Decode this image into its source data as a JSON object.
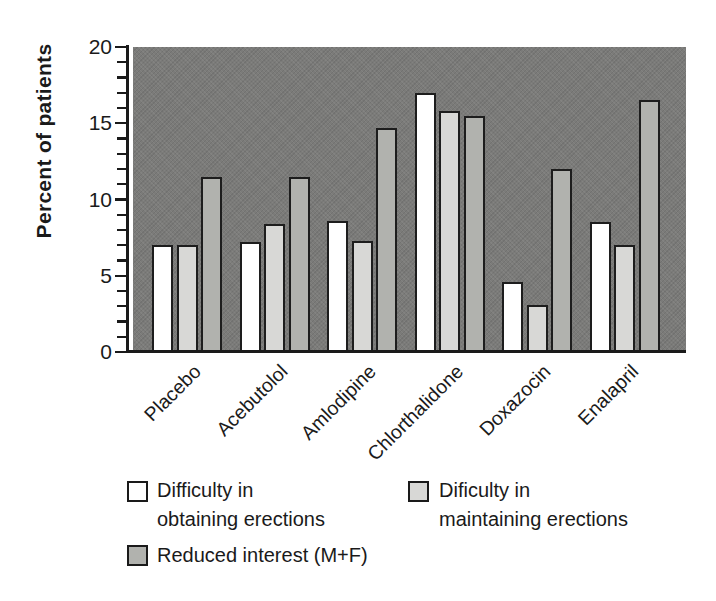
{
  "chart_data": {
    "type": "bar",
    "title": "",
    "ylabel": "Percent of patients",
    "xlabel": "",
    "ylim": [
      0,
      20
    ],
    "y_major_ticks": [
      0,
      5,
      10,
      15,
      20
    ],
    "y_minor_step": 1,
    "grid": false,
    "legend_position": "bottom",
    "plot_background": "#7b7b79",
    "axis_color": "#1a1a1a",
    "categories": [
      "Placebo",
      "Acebutolol",
      "Amlodipine",
      "Chlorthalidone",
      "Doxazocin",
      "Enalapril"
    ],
    "series": [
      {
        "name": "Difficulty in obtaining erections",
        "color": "#ffffff",
        "values": [
          7.0,
          7.2,
          8.6,
          17.0,
          4.6,
          8.5
        ]
      },
      {
        "name": "Dificulty in maintaining erections",
        "color": "#d8d8d6",
        "values": [
          7.0,
          8.4,
          7.3,
          15.8,
          3.1,
          7.0
        ]
      },
      {
        "name": "Reduced interest (M+F)",
        "color": "#b1b2ae",
        "values": [
          11.5,
          11.5,
          14.7,
          15.5,
          12.0,
          16.5
        ]
      }
    ]
  },
  "legend": {
    "items": [
      {
        "line1": "Difficulty in",
        "line2": "obtaining erections",
        "swatch": "#ffffff"
      },
      {
        "line1": "Dificulty in",
        "line2": "maintaining erections",
        "swatch": "#d8d8d6"
      },
      {
        "line1": "Reduced interest (M+F)",
        "line2": "",
        "swatch": "#b1b2ae"
      }
    ]
  }
}
